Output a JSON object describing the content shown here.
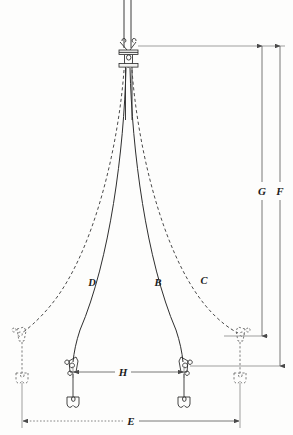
{
  "diagram": {
    "background_color": "#fdfdfc",
    "line_color": "#2e2e2e",
    "label_color": "#1b1b1b"
  },
  "stay_labels": [
    {
      "id": "D",
      "text": "D",
      "x": 92,
      "y": 286,
      "style": "solid",
      "side": "port",
      "note": "port inner shroud"
    },
    {
      "id": "B",
      "text": "B",
      "x": 158,
      "y": 286,
      "style": "solid",
      "side": "starboard",
      "note": "starboard inner shroud"
    },
    {
      "id": "C",
      "text": "C",
      "x": 204,
      "y": 284,
      "style": "dashed",
      "side": "starboard",
      "note": "starboard outer shroud"
    }
  ],
  "dimension_labels": [
    {
      "id": "G",
      "text": "G",
      "x": 265,
      "y": 190,
      "orientation": "vertical",
      "note": "masthead to outer chainplate height"
    },
    {
      "id": "F",
      "text": "F",
      "x": 281,
      "y": 190,
      "orientation": "vertical",
      "note": "masthead to deck height"
    },
    {
      "id": "H",
      "text": "H",
      "x": 122,
      "y": 374,
      "orientation": "horizontal",
      "note": "inner chainplate spacing"
    },
    {
      "id": "E",
      "text": "E",
      "x": 131,
      "y": 422,
      "orientation": "horizontal",
      "note": "outer chainplate spacing"
    }
  ],
  "fittings": [
    {
      "name": "masthead-band",
      "style": "solid",
      "x": 130,
      "y": 52
    },
    {
      "name": "inner-chainplate-port",
      "style": "solid",
      "x": 73,
      "y": 366
    },
    {
      "name": "inner-chainplate-stbd",
      "style": "solid",
      "x": 184,
      "y": 366
    },
    {
      "name": "outer-chainplate-port",
      "style": "dashed",
      "x": 22,
      "y": 332
    },
    {
      "name": "outer-chainplate-stbd",
      "style": "dashed",
      "x": 240,
      "y": 332
    },
    {
      "name": "toggle-port-outer",
      "style": "dashed",
      "x": 22,
      "y": 378
    },
    {
      "name": "toggle-port-inner",
      "style": "solid",
      "x": 73,
      "y": 402
    },
    {
      "name": "toggle-stbd-inner",
      "style": "solid",
      "x": 184,
      "y": 402
    },
    {
      "name": "toggle-stbd-outer",
      "style": "dashed",
      "x": 240,
      "y": 378
    }
  ],
  "reference_lines": [
    {
      "name": "masthead-datum",
      "y": 46,
      "note": "top datum for G and F"
    },
    {
      "name": "outer-chainplate-datum",
      "y": 336,
      "note": "lower terminus for G"
    },
    {
      "name": "deck-datum",
      "y": 366,
      "note": "lower terminus for F"
    }
  ]
}
